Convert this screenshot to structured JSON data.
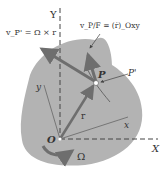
{
  "diagram": {
    "labels": {
      "Y": "Y",
      "X": "X",
      "y": "y",
      "x": "x",
      "O": "O",
      "P": "P",
      "P_prime": "P'",
      "r": "r",
      "Omega": "Ω",
      "v_pf_eq": "v_P' = Ω × r",
      "v_pf_rel_eq": "v_P/F = (ṙ)_Oxy"
    },
    "colors": {
      "body_fill": "#b3b3b3",
      "arrow": "#6e6e6e",
      "axis_dash": "#444444",
      "text": "#333333"
    }
  }
}
